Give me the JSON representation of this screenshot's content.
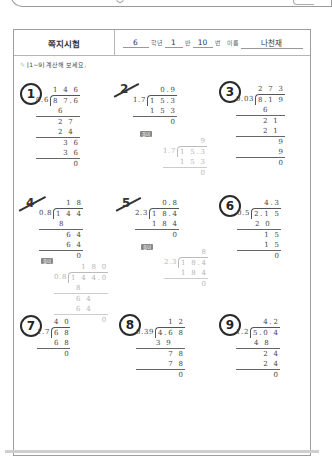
{
  "header": {
    "title": "쪽지시험",
    "grade": "6",
    "grade_label": "학년",
    "class": "1",
    "class_label": "반",
    "number": "10",
    "number_label": "번",
    "name_label": "이름",
    "name": "나천재"
  },
  "instruction": "[1~9] 계산해 보세요.",
  "solution_label": "풀이",
  "problems": [
    {
      "num": "1",
      "mark": "circle",
      "divisor": "0.6",
      "dividend": "8 7.6",
      "quotient": "1 4 6",
      "steps": [
        "6",
        "2 7",
        "2 4",
        "3 6",
        "3 6",
        "0"
      ]
    },
    {
      "num": "2",
      "mark": "slash",
      "divisor": "1.7",
      "dividend": "1 5.3",
      "quotient": "0.9",
      "steps": [
        "1 5 3",
        "0"
      ],
      "correction": {
        "divisor": "1.7",
        "dividend": "1 5.3",
        "quotient": "9",
        "steps": [
          "1 5 3",
          "0"
        ]
      }
    },
    {
      "num": "3",
      "mark": "circle",
      "divisor": "0.03",
      "dividend": "8.1 9",
      "quotient": "2 7 3",
      "steps": [
        "6",
        "2 1",
        "2 1",
        "9",
        "9",
        "0"
      ]
    },
    {
      "num": "4",
      "mark": "slash",
      "divisor": "0.8",
      "dividend": "1 4 4",
      "quotient": "1 8",
      "steps": [
        "8",
        "6 4",
        "6 4",
        "0"
      ],
      "correction": {
        "divisor": "0.8",
        "dividend": "1 4 4.0",
        "quotient": "1 8 0",
        "steps": [
          "8",
          "6 4",
          "6 4",
          "0"
        ]
      }
    },
    {
      "num": "5",
      "mark": "slash",
      "divisor": "2.3",
      "dividend": "1 8.4",
      "quotient": "0.8",
      "steps": [
        "1 8 4",
        "0"
      ],
      "correction": {
        "divisor": "2.3",
        "dividend": "1 8.4",
        "quotient": "8",
        "steps": [
          "1 8 4",
          "0"
        ]
      }
    },
    {
      "num": "6",
      "mark": "circle",
      "divisor": "0.5",
      "dividend": "2.1 5",
      "quotient": "4.3",
      "steps": [
        "2 0",
        "1 5",
        "1 5",
        "0"
      ]
    },
    {
      "num": "7",
      "mark": "circle",
      "divisor": "1.7",
      "dividend": "6 8",
      "quotient": "4 0",
      "steps": [
        "6 8",
        "0"
      ]
    },
    {
      "num": "8",
      "mark": "circle",
      "divisor": "0.39",
      "dividend": "4.6 8",
      "quotient": "1 2",
      "steps": [
        "3 9",
        "7 8",
        "7 8",
        "0"
      ]
    },
    {
      "num": "9",
      "mark": "circle",
      "divisor": "1.2",
      "dividend": "5.0 4",
      "quotient": "4.2",
      "steps": [
        "4 8",
        "2 4",
        "2 4",
        "0"
      ]
    }
  ]
}
